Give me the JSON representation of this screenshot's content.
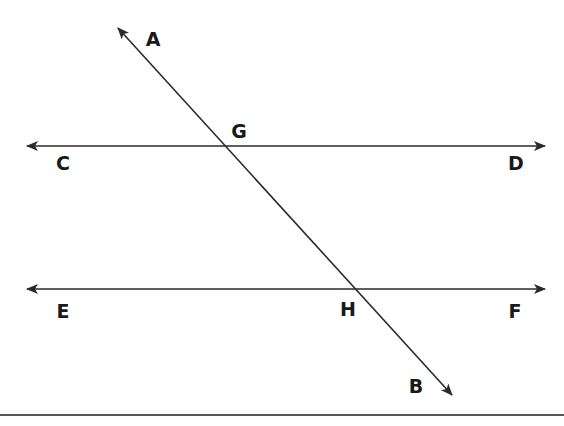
{
  "diagram": {
    "colors": {
      "line": "#2a2a2a",
      "label": "#1a1a1a",
      "rule": "#555555",
      "background": "#ffffff"
    },
    "lines": [
      {
        "id": "AB",
        "name": "transversal",
        "from": "A",
        "to": "B",
        "x1": 118,
        "y1": 28,
        "x2": 452,
        "y2": 395,
        "arrows": "both"
      },
      {
        "id": "CD",
        "name": "parallel-line-top",
        "from": "C",
        "to": "D",
        "x1": 26,
        "y1": 146,
        "x2": 546,
        "y2": 146,
        "arrows": "both"
      },
      {
        "id": "EF",
        "name": "parallel-line-bottom",
        "from": "E",
        "to": "F",
        "x1": 26,
        "y1": 289,
        "x2": 546,
        "y2": 289,
        "arrows": "both"
      }
    ],
    "labels": {
      "A": "A",
      "B": "B",
      "C": "C",
      "D": "D",
      "E": "E",
      "F": "F",
      "G": "G",
      "H": "H"
    },
    "intersections": [
      {
        "point": "G",
        "lines": [
          "AB",
          "CD"
        ],
        "x": 225,
        "y": 146
      },
      {
        "point": "H",
        "lines": [
          "AB",
          "EF"
        ],
        "x": 355,
        "y": 289
      }
    ]
  }
}
